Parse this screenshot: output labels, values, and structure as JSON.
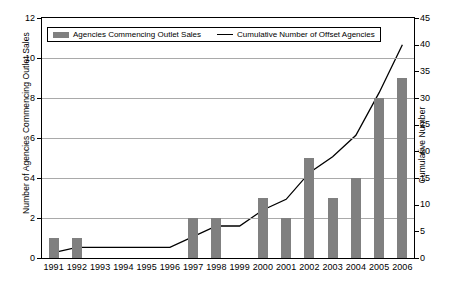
{
  "chart_data": {
    "type": "bar",
    "title": "",
    "xlabel": "",
    "ylabel": "Number of Agencies Commencing Outlet Sales",
    "y2label": "Cumulative Number",
    "categories": [
      "1991",
      "1992",
      "1993",
      "1994",
      "1995",
      "1996",
      "1997",
      "1998",
      "1999",
      "2000",
      "2001",
      "2002",
      "2003",
      "2004",
      "2005",
      "2006"
    ],
    "ylim": [
      0,
      12
    ],
    "yticks": [
      0,
      2,
      4,
      6,
      8,
      10,
      12
    ],
    "y2lim": [
      0,
      45
    ],
    "y2ticks": [
      0,
      5,
      10,
      15,
      20,
      25,
      30,
      35,
      40,
      45
    ],
    "grid": true,
    "legend_position": "top",
    "series": [
      {
        "name": "Agencies Commencing Outlet Sales",
        "type": "bar",
        "axis": "left",
        "color": "#808080",
        "values": [
          1,
          1,
          0,
          0,
          0,
          0,
          2,
          2,
          0,
          3,
          2,
          5,
          3,
          4,
          8,
          9
        ]
      },
      {
        "name": "Cumulative Number of Offset Agencies",
        "type": "line",
        "axis": "right",
        "color": "#000000",
        "values": [
          1,
          2,
          2,
          2,
          2,
          2,
          4,
          6,
          6,
          9,
          11,
          16,
          19,
          23,
          31,
          40
        ]
      }
    ]
  },
  "legend": {
    "bar_label": "Agencies Commencing Outlet Sales",
    "line_label": "Cumulative Number of Offset Agencies"
  },
  "axes": {
    "left_title": "Number of Agencies Commencing Outlet Sales",
    "right_title": "Cumulative Number"
  }
}
